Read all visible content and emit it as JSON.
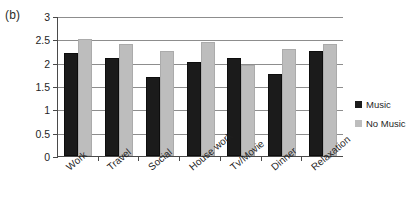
{
  "panel": {
    "label": "(b)"
  },
  "legend": {
    "position": "right",
    "items": [
      {
        "label": "Music",
        "color": "#1b1b1b",
        "swatch_name": "legend-swatch-music"
      },
      {
        "label": "No Music",
        "color": "#bdbdbd",
        "swatch_name": "legend-swatch-no-music"
      }
    ]
  },
  "axis": {
    "y_ticks": [
      "0",
      "0.5",
      "1",
      "1.5",
      "2",
      "2.5",
      "3"
    ],
    "y_tick_values": [
      0,
      0.5,
      1,
      1.5,
      2,
      2.5,
      3
    ]
  },
  "chart_data": {
    "type": "bar",
    "title": "(b)",
    "xlabel": "",
    "ylabel": "",
    "ylim": [
      0,
      3
    ],
    "ytick_step": 0.5,
    "grid": true,
    "legend_position": "right",
    "categories": [
      "Work",
      "Travel",
      "Social",
      "House work",
      "Tv/Movie",
      "Dinner",
      "Relaxation"
    ],
    "series": [
      {
        "name": "Music",
        "color": "#1b1b1b",
        "values": [
          2.2,
          2.1,
          1.7,
          2.02,
          2.1,
          1.75,
          2.25
        ]
      },
      {
        "name": "No Music",
        "color": "#bdbdbd",
        "values": [
          2.5,
          2.4,
          2.25,
          2.45,
          1.95,
          2.3,
          2.4
        ]
      }
    ]
  }
}
